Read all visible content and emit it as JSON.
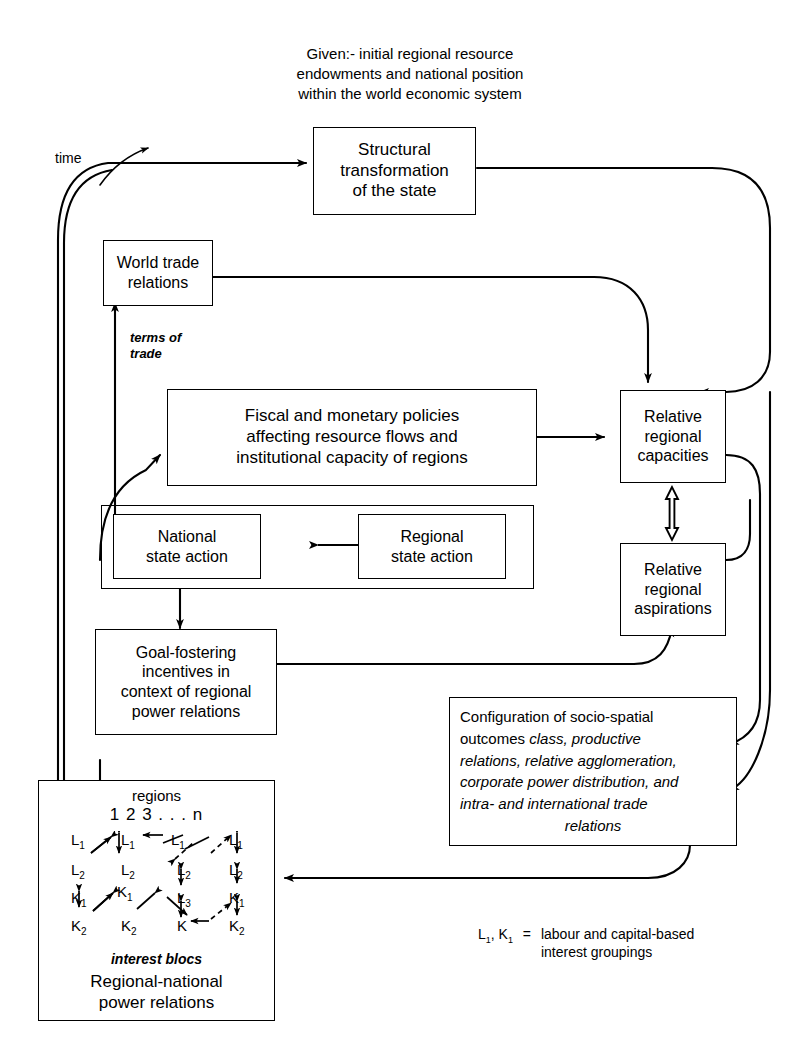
{
  "header": {
    "text": "Given:- initial regional resource\nendowments and national position\nwithin the world economic system"
  },
  "labels": {
    "time": "time",
    "terms_of_trade": "terms of\ntrade",
    "interest_blocs": "interest blocs",
    "regions": "regions",
    "region_numbers": "1     2     3 . . . n"
  },
  "boxes": {
    "structural": "Structural\ntransformation\nof the state",
    "world_trade": "World trade\nrelations",
    "fiscal": "Fiscal and monetary policies\naffecting resource flows and\ninstitutional capacity of regions",
    "national_state": "National\nstate action",
    "regional_state": "Regional\nstate action",
    "goal_fostering": "Goal-fostering\nincentives in\ncontext of regional\npower relations",
    "relative_capacities": "Relative\nregional\ncapacities",
    "relative_aspirations": "Relative\nregional\naspirations",
    "regional_national": "Regional-national\npower relations"
  },
  "configuration": {
    "line1": "Configuration of socio-spatial",
    "line2_plain": "outcomes ",
    "line2_italic": "class, productive",
    "line3_italic": "relations, relative agglomeration,",
    "line4_italic": "corporate power distribution, and",
    "line5_italic": "intra- and  international trade",
    "line6_italic": "relations"
  },
  "matrix": {
    "row_labels": [
      "L",
      "L",
      "K",
      "K"
    ],
    "cells": [
      {
        "t": "L",
        "s": "1",
        "x": 12,
        "y": 0
      },
      {
        "t": "L",
        "s": "1",
        "x": 62,
        "y": 0
      },
      {
        "t": "L",
        "s": "1",
        "x": 112,
        "y": 0
      },
      {
        "t": "L",
        "s": "1",
        "x": 170,
        "y": 0
      },
      {
        "t": "L",
        "s": "2",
        "x": 12,
        "y": 30
      },
      {
        "t": "L",
        "s": "2",
        "x": 62,
        "y": 30
      },
      {
        "t": "L",
        "s": "2",
        "x": 118,
        "y": 30
      },
      {
        "t": "L",
        "s": "2",
        "x": 170,
        "y": 30
      },
      {
        "t": "K",
        "s": "1",
        "x": 12,
        "y": 58
      },
      {
        "t": "K",
        "s": "1",
        "x": 58,
        "y": 52
      },
      {
        "t": "L",
        "s": "3",
        "x": 118,
        "y": 58
      },
      {
        "t": "K",
        "s": "1",
        "x": 170,
        "y": 58
      },
      {
        "t": "K",
        "s": "2",
        "x": 12,
        "y": 86
      },
      {
        "t": "K",
        "s": "2",
        "x": 62,
        "y": 86
      },
      {
        "t": "K",
        "s": "",
        "x": 118,
        "y": 86
      },
      {
        "t": "K",
        "s": "2",
        "x": 170,
        "y": 86
      }
    ]
  },
  "legend": {
    "symbols_L": "L",
    "symbols_L_sub": "1",
    "symbols_K": "K",
    "symbols_K_sub": "1",
    "equals": "=",
    "text": "labour and capital-based\ninterest groupings"
  },
  "colors": {
    "ink": "#000000",
    "paper": "#ffffff"
  }
}
